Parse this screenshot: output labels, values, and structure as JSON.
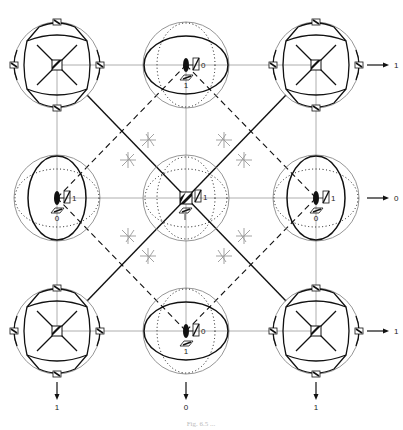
{
  "diagram": {
    "type": "crystal-lattice-orbital-diagram",
    "grid": {
      "columns_x": [
        57,
        186,
        316
      ],
      "rows_y": [
        65,
        198,
        331
      ],
      "sphere_radius": 43
    },
    "nodes": [
      {
        "row": 0,
        "col": 0,
        "kind": "cubic-cluster"
      },
      {
        "row": 0,
        "col": 1,
        "kind": "horizontal-ellipse",
        "spin_label": "0",
        "lower_label": "1"
      },
      {
        "row": 0,
        "col": 2,
        "kind": "cubic-cluster"
      },
      {
        "row": 1,
        "col": 0,
        "kind": "vertical-ellipse",
        "spin_label": "1",
        "lower_label": "0"
      },
      {
        "row": 1,
        "col": 1,
        "kind": "central-sphere",
        "spin_label": "1",
        "lower_label": "1"
      },
      {
        "row": 1,
        "col": 2,
        "kind": "vertical-ellipse",
        "spin_label": "1",
        "lower_label": "0"
      },
      {
        "row": 2,
        "col": 0,
        "kind": "cubic-cluster"
      },
      {
        "row": 2,
        "col": 1,
        "kind": "horizontal-ellipse",
        "spin_label": "0",
        "lower_label": "1"
      },
      {
        "row": 2,
        "col": 2,
        "kind": "cubic-cluster"
      }
    ],
    "arrows": {
      "right": [
        {
          "row": 0,
          "label": "1"
        },
        {
          "row": 1,
          "label": "0"
        },
        {
          "row": 2,
          "label": "1"
        }
      ],
      "down": [
        {
          "col": 0,
          "label": "1"
        },
        {
          "col": 1,
          "label": "0"
        },
        {
          "col": 2,
          "label": "1"
        }
      ]
    },
    "caption": "Fig. 6.5 ..."
  },
  "colors": {
    "ink": "#111111",
    "grid_line": "#999999",
    "sphere_outline": "#8a8a8a"
  }
}
